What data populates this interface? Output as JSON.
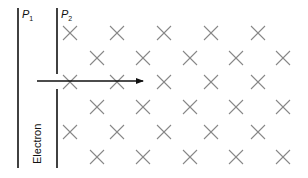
{
  "diagram": {
    "plates": [
      {
        "id": "P1",
        "label": "P",
        "subscript": "1",
        "x": 18,
        "y1": 8,
        "y2": 168
      },
      {
        "id": "P2",
        "label": "P",
        "subscript": "2",
        "x": 57,
        "segments": [
          [
            8,
            74
          ],
          [
            89,
            168
          ]
        ]
      }
    ],
    "particle_label": "Electron",
    "velocity_arrow": {
      "x1": 37,
      "y": 81,
      "x2": 143
    },
    "magnetic_field": {
      "direction": "into-page",
      "symbol": "cross",
      "color": "#888888",
      "rows": [
        {
          "y": 33,
          "xs": [
            70,
            117,
            164,
            211,
            258
          ]
        },
        {
          "y": 58,
          "xs": [
            97,
            143,
            190,
            236,
            283
          ]
        },
        {
          "y": 82,
          "xs": [
            70,
            117,
            164,
            211,
            258
          ]
        },
        {
          "y": 107,
          "xs": [
            97,
            143,
            190,
            236,
            283
          ]
        },
        {
          "y": 132,
          "xs": [
            70,
            117,
            164,
            211,
            258
          ]
        },
        {
          "y": 157,
          "xs": [
            97,
            143,
            190,
            236,
            283
          ]
        }
      ]
    }
  }
}
